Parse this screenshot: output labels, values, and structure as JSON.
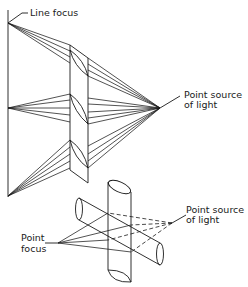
{
  "figure": {
    "top_diagram": {
      "label_line_focus": "Line focus",
      "label_source_line1": "Point source",
      "label_source_line2": "of light"
    },
    "bottom_diagram": {
      "label_focus_line1": "Point",
      "label_focus_line2": "focus",
      "label_source_line1": "Point source",
      "label_source_line2": "of light"
    },
    "colors": {
      "line": "#1a1a1a",
      "background": "#ffffff"
    }
  }
}
